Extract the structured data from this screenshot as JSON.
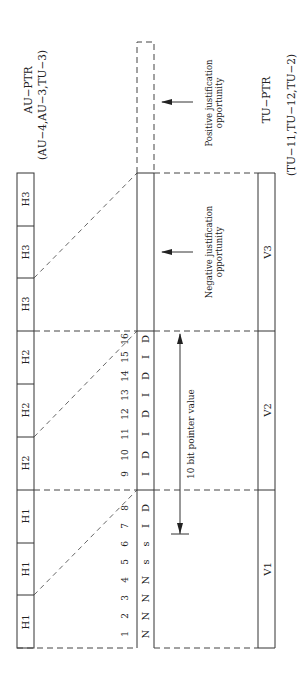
{
  "au_ptr": {
    "title": "AU−PTR",
    "subtitle": "(AU−4,AU−3,TU−3)"
  },
  "tu_ptr": {
    "title": "TU−PTR",
    "subtitle": "(TU−11,TU−12,TU−2)"
  },
  "header_bytes": [
    "H1",
    "H1",
    "H1",
    "H2",
    "H2",
    "H2",
    "H3",
    "H3",
    "H3"
  ],
  "bit_numbers": [
    "1",
    "2",
    "3",
    "4",
    "5",
    "6",
    "7",
    "8",
    "9",
    "10",
    "11",
    "12",
    "13",
    "14",
    "15",
    "16"
  ],
  "bit_types": [
    "N",
    "N",
    "N",
    "N",
    "s",
    "s",
    "I",
    "D",
    "I",
    "D",
    "I",
    "D",
    "I",
    "D",
    "I",
    "D"
  ],
  "v_bytes": [
    "V1",
    "V2",
    "V3"
  ],
  "pointer_label": "10 bit pointer value",
  "negative_justification": {
    "line1": "Negative justification",
    "line2": "opportunity"
  },
  "positive_justification": {
    "line1": "Positive justification",
    "line2": "opportunity"
  }
}
